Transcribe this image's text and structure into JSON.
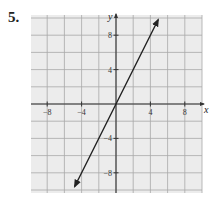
{
  "problem_number": "5.",
  "chart_data": {
    "type": "line",
    "title": "",
    "xlabel": "x",
    "ylabel": "y",
    "xlim": [
      -10,
      10
    ],
    "ylim": [
      -10,
      10
    ],
    "grid": true,
    "grid_step": 2,
    "x_ticks": [
      -8,
      -4,
      4,
      8
    ],
    "y_ticks": [
      8,
      4,
      -4,
      -8
    ],
    "x_tick_labels": [
      "−8",
      "−4",
      "4",
      "8"
    ],
    "y_tick_labels": [
      "8",
      "4",
      "−4",
      "−8"
    ],
    "series": [
      {
        "name": "y = 2x",
        "equation": "y = 2x",
        "x": [
          -4.8,
          0,
          4.9
        ],
        "y": [
          -9.6,
          0,
          9.8
        ],
        "arrows_both_ends": true,
        "color": "#222222"
      }
    ],
    "colors": {
      "grid": "#a8a8a8",
      "grid_bg": "#ececec",
      "axis": "#333333",
      "line": "#222222"
    }
  }
}
